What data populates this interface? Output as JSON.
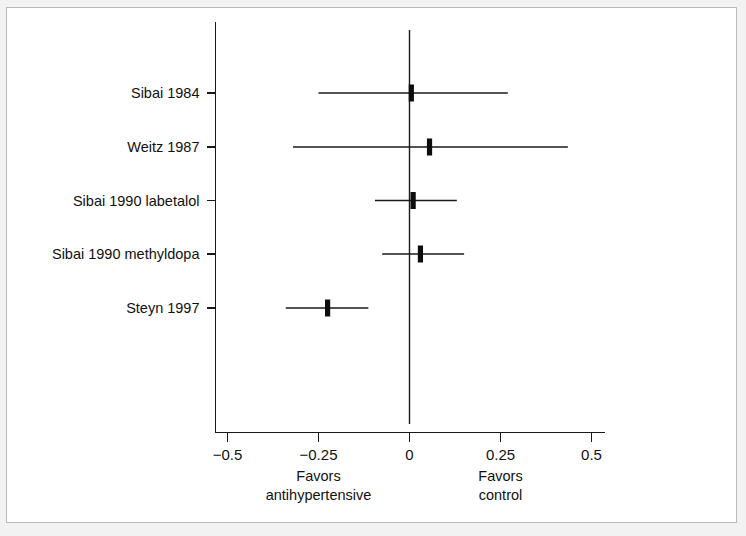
{
  "chart_data": {
    "type": "scatter",
    "subtype": "forest-plot",
    "title": "",
    "xlabel": "",
    "ylabel": "",
    "xlim": [
      -0.5,
      0.5
    ],
    "grid": false,
    "legend": null,
    "reference_line": 0,
    "x_ticks": [
      {
        "value": -0.5,
        "label": "−0.5"
      },
      {
        "value": -0.25,
        "label": "−0.25"
      },
      {
        "value": 0,
        "label": "0"
      },
      {
        "value": 0.25,
        "label": "0.25"
      },
      {
        "value": 0.5,
        "label": "0.5"
      }
    ],
    "categories": [
      "Sibai 1984",
      "Weitz 1987",
      "Sibai 1990 labetalol",
      "Sibai 1990 methyldopa",
      "Steyn 1997"
    ],
    "points": [
      {
        "study": "Sibai 1984",
        "estimate": 0.005,
        "ci_low": -0.25,
        "ci_high": 0.27
      },
      {
        "study": "Weitz 1987",
        "estimate": 0.055,
        "ci_low": -0.32,
        "ci_high": 0.435
      },
      {
        "study": "Sibai 1990 labetalol",
        "estimate": 0.01,
        "ci_low": -0.095,
        "ci_high": 0.13
      },
      {
        "study": "Sibai 1990 methyldopa",
        "estimate": 0.03,
        "ci_low": -0.075,
        "ci_high": 0.15
      },
      {
        "study": "Steyn 1997",
        "estimate": -0.225,
        "ci_low": -0.34,
        "ci_high": -0.113
      }
    ],
    "annotations": [
      {
        "text_lines": [
          "Favors",
          "antihypertensive"
        ],
        "at_x": -0.25,
        "side": "left"
      },
      {
        "text_lines": [
          "Favors",
          "control"
        ],
        "at_x": 0.25,
        "side": "right"
      }
    ]
  },
  "axis_captions": {
    "left_line1": "Favors",
    "left_line2": "antihypertensive",
    "right_line1": "Favors",
    "right_line2": "control"
  },
  "colors": {
    "ink": "#111111",
    "page": "#ffffff",
    "page_border": "#b9b9b9",
    "backdrop": "#f2f2f2"
  }
}
